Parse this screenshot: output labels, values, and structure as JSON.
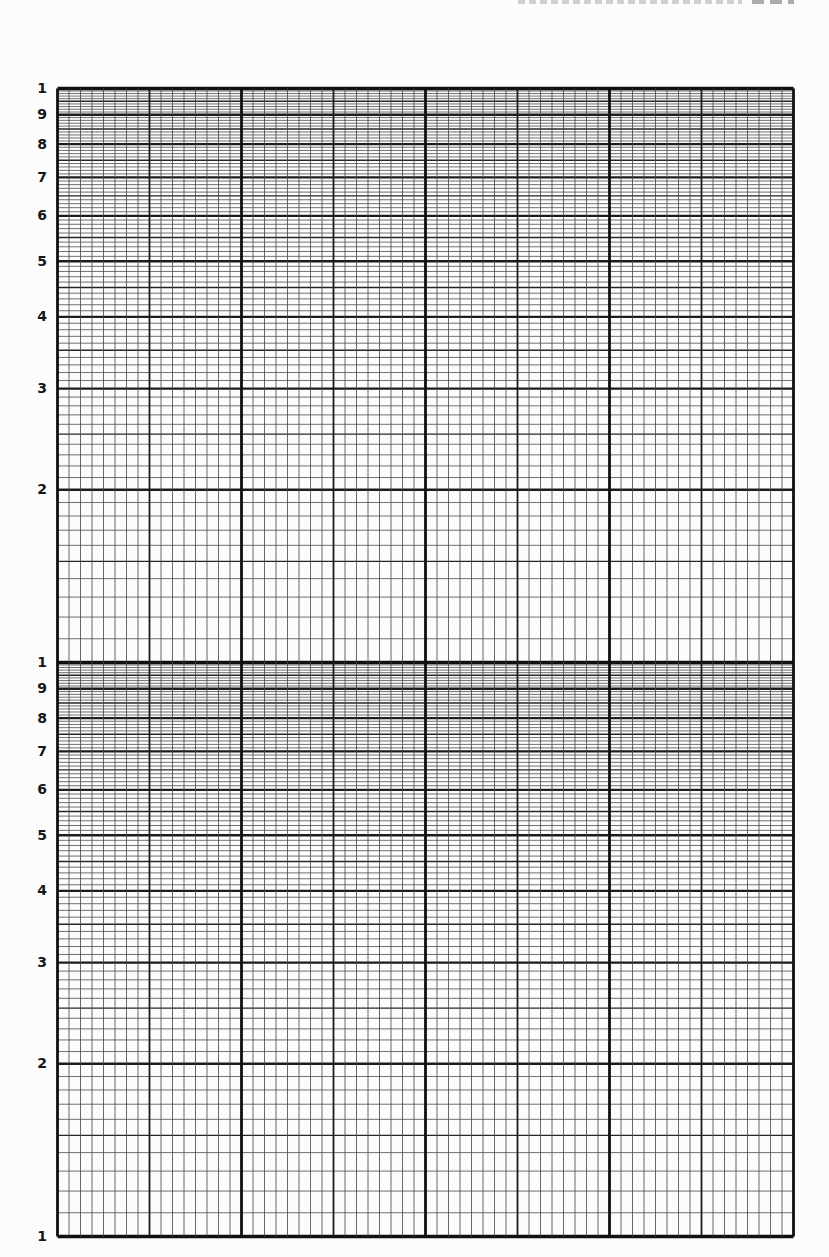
{
  "page": {
    "paper_color": "#fcfcfa",
    "header": {
      "running_head_visible_text": "",
      "page_number_visible_text": "",
      "clipped": true
    }
  },
  "graph_paper": {
    "description": "blank two-cycle semi-logarithmic graph grid",
    "y_axis": {
      "scale": "log",
      "decades": 2,
      "minor_step": 0.1,
      "emphasized_minor_at": 0.5,
      "tick_labels": [
        {
          "text": "1",
          "decade": 0,
          "value": 10
        },
        {
          "text": "9",
          "decade": 0,
          "value": 9
        },
        {
          "text": "8",
          "decade": 0,
          "value": 8
        },
        {
          "text": "7",
          "decade": 0,
          "value": 7
        },
        {
          "text": "6",
          "decade": 0,
          "value": 6
        },
        {
          "text": "5",
          "decade": 0,
          "value": 5
        },
        {
          "text": "4",
          "decade": 0,
          "value": 4
        },
        {
          "text": "3",
          "decade": 0,
          "value": 3
        },
        {
          "text": "2",
          "decade": 0,
          "value": 2
        },
        {
          "text": "1",
          "decade": 1,
          "value": 10
        },
        {
          "text": "9",
          "decade": 1,
          "value": 9
        },
        {
          "text": "8",
          "decade": 1,
          "value": 8
        },
        {
          "text": "7",
          "decade": 1,
          "value": 7
        },
        {
          "text": "6",
          "decade": 1,
          "value": 6
        },
        {
          "text": "5",
          "decade": 1,
          "value": 5
        },
        {
          "text": "4",
          "decade": 1,
          "value": 4
        },
        {
          "text": "3",
          "decade": 1,
          "value": 3
        },
        {
          "text": "2",
          "decade": 1,
          "value": 2
        },
        {
          "text": "1",
          "decade": 1,
          "value": 1
        }
      ]
    },
    "x_axis": {
      "scale": "linear",
      "major_divisions": 4,
      "medium_per_major": 2,
      "small_per_medium": 8,
      "tick_labels": []
    },
    "plotted_series": [],
    "colors": {
      "ink_heavy": "#101010",
      "ink_major": "#1c1c1c",
      "ink_medium": "#262626",
      "ink_minor": "#414141"
    }
  }
}
